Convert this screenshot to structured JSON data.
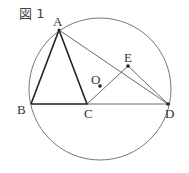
{
  "figure": {
    "label": "図 1"
  },
  "points": {
    "A": "A",
    "B": "B",
    "C": "C",
    "D": "D",
    "E": "E",
    "O": "O"
  }
}
